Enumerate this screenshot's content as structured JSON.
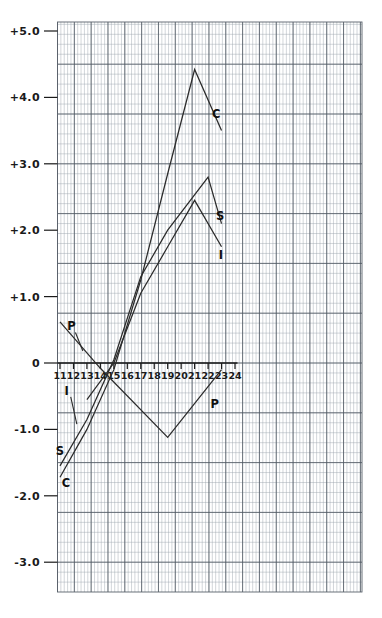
{
  "chart_data": {
    "type": "line",
    "title": "",
    "subtitle": "",
    "xlabel": "",
    "ylabel": "",
    "xlim": [
      10.4,
      24.6
    ],
    "ylim": [
      -3.45,
      5.3
    ],
    "xticks": [
      11,
      12,
      13,
      14,
      15,
      16,
      17,
      18,
      19,
      20,
      21,
      22,
      23,
      24
    ],
    "xtick_labels": [
      "11",
      "12",
      "13",
      "14",
      "15",
      "16",
      "17",
      "18",
      "19",
      "20",
      "21",
      "22",
      "23",
      "24"
    ],
    "yticks": [
      5.0,
      4.0,
      3.0,
      2.0,
      1.0,
      0.0,
      -1.0,
      -2.0,
      -3.0
    ],
    "ytick_labels": [
      "+5.0",
      "+4.0",
      "+3.0",
      "+2.0",
      "+1.0",
      "0",
      "-1.0",
      "-2.0",
      "-3.0"
    ],
    "grid": true,
    "grid_minor_step_x": 0.25,
    "grid_minor_step_y": 0.15,
    "legend_position": "inline-end-labels",
    "series": [
      {
        "name": "C",
        "label": "C",
        "label_x": 22.6,
        "label_y": 3.75,
        "x": [
          11,
          13,
          15,
          17,
          19,
          21,
          23
        ],
        "y": [
          -1.72,
          -1.0,
          -0.1,
          1.25,
          2.85,
          4.42,
          3.5
        ]
      },
      {
        "name": "S",
        "label": "S",
        "label_x": 22.9,
        "label_y": 2.22,
        "x": [
          11,
          13,
          15,
          17,
          19,
          22,
          23
        ],
        "y": [
          -1.55,
          -0.85,
          0.05,
          1.3,
          2.0,
          2.8,
          2.1
        ]
      },
      {
        "name": "I",
        "label": "I",
        "label_x": 22.95,
        "label_y": 1.62,
        "x": [
          13,
          15,
          17,
          19,
          21,
          23
        ],
        "y": [
          -0.55,
          0.0,
          1.05,
          1.75,
          2.45,
          1.75
        ]
      },
      {
        "name": "P",
        "label": "P",
        "label_x": 22.5,
        "label_y": -0.62,
        "x": [
          11,
          14,
          19,
          23
        ],
        "y": [
          0.62,
          -0.08,
          -1.12,
          -0.1
        ]
      }
    ],
    "annotations": [
      {
        "text": "P",
        "x": 11.85,
        "y": 0.55,
        "leader_to_x": 12.7,
        "leader_to_y": 0.18
      },
      {
        "text": "I",
        "x": 11.5,
        "y": -0.42,
        "leader_to_x": 12.25,
        "leader_to_y": -0.92
      },
      {
        "text": "S",
        "x": 11.0,
        "y": -1.32,
        "leader_to_x": null,
        "leader_to_y": null
      },
      {
        "text": "C",
        "x": 11.45,
        "y": -1.8,
        "leader_to_x": null,
        "leader_to_y": null
      }
    ],
    "colors": {
      "curve": "#2b2b2b",
      "grid_minor": "#9aa3ad",
      "grid_major": "#4d5560",
      "axis": "#1a1a1a",
      "background": "#ffffff"
    }
  }
}
